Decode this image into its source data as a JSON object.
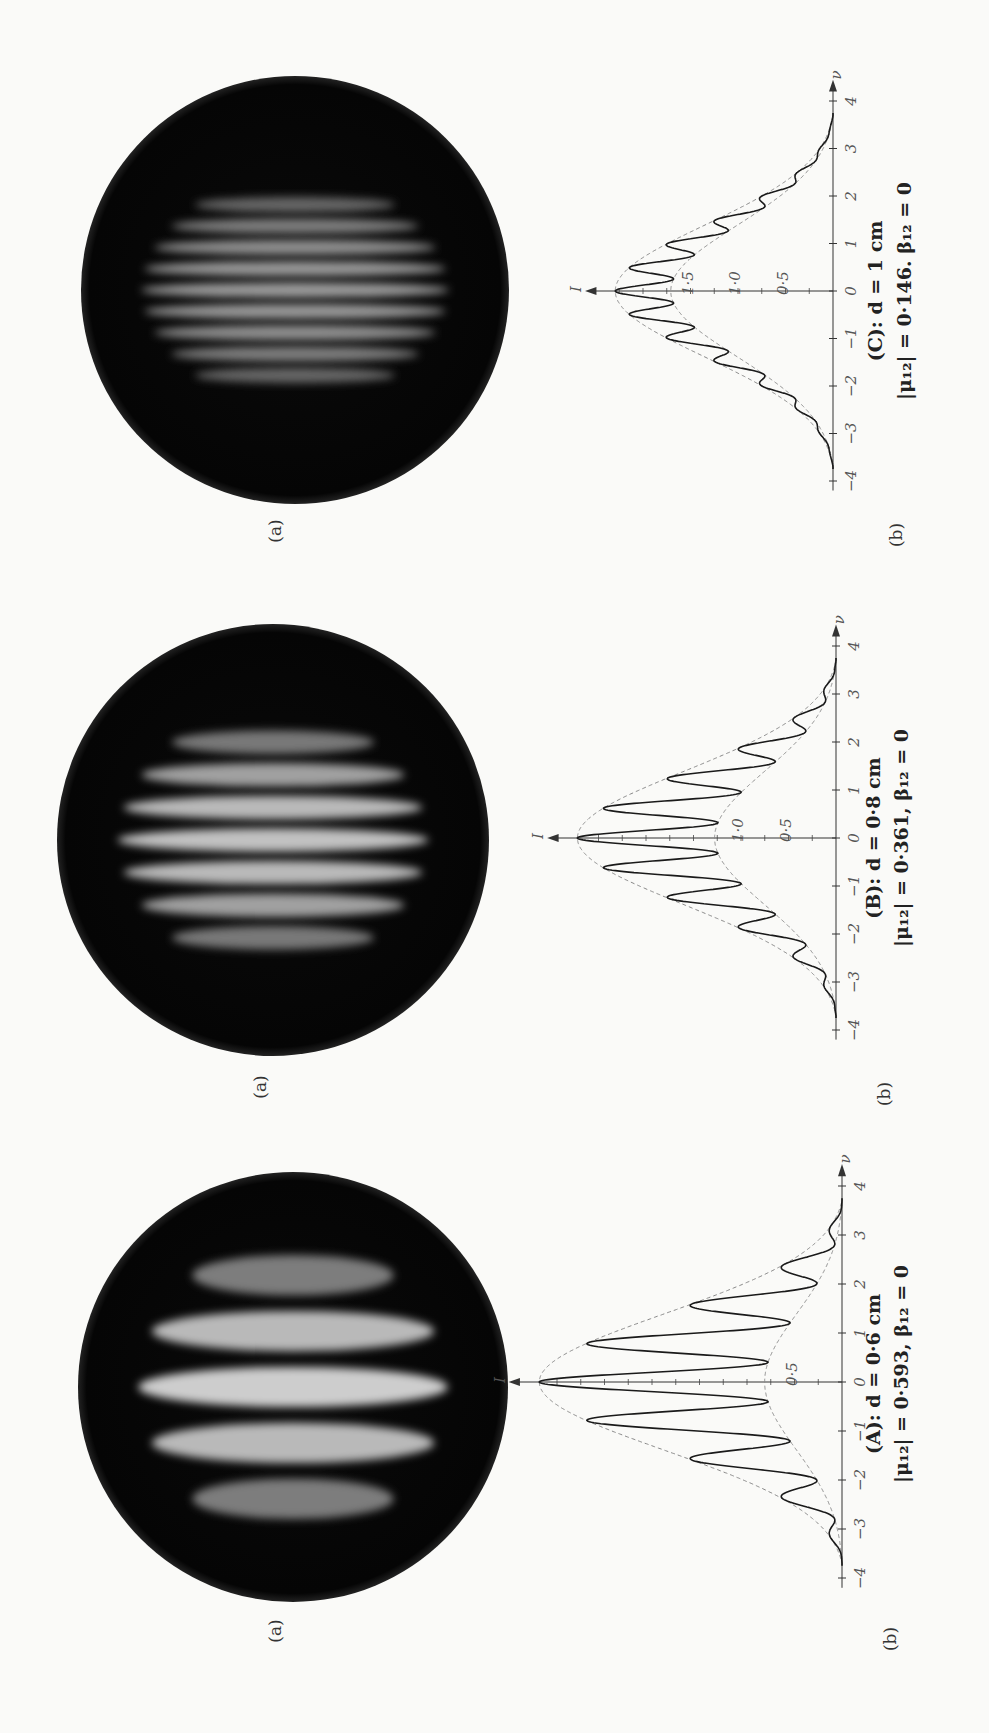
{
  "figure": {
    "orientation": "rotated-90-ccw",
    "panels": [
      {
        "id": "C",
        "photo_label": "(a)",
        "plot_label": "(b)",
        "caption_line1": "(C): d = 1 cm",
        "caption_line2": "|μ₁₂| = 0·146. β₁₂ = 0",
        "fringe_count": 9,
        "fringe_brightness": 0.55,
        "layout": {
          "disk_cx": 295,
          "disk_cy": 290,
          "disk_r": 214,
          "base_x": 833,
          "nu0_y": 291,
          "px_per_nu": 47.5,
          "px_per_I": 95,
          "photo_label_x": 281,
          "photo_label_y": 531,
          "plot_label_x": 902,
          "plot_label_y": 535,
          "cap_x1": 882,
          "cap_x2": 911,
          "cap_y": 291
        }
      },
      {
        "id": "B",
        "photo_label": "(a)",
        "plot_label": "(b)",
        "caption_line1": "(B): d = 0·8 cm",
        "caption_line2": "|μ₁₂| = 0·361, β₁₂ = 0",
        "fringe_count": 7,
        "fringe_brightness": 0.78,
        "layout": {
          "disk_cx": 273,
          "disk_cy": 840,
          "disk_r": 216,
          "base_x": 836,
          "nu0_y": 838,
          "px_per_nu": 48,
          "px_per_I": 95,
          "photo_label_x": 266,
          "photo_label_y": 1087,
          "plot_label_x": 890,
          "plot_label_y": 1094,
          "cap_x1": 880,
          "cap_x2": 908,
          "cap_y": 838
        }
      },
      {
        "id": "A",
        "photo_label": "(a)",
        "plot_label": "(b)",
        "caption_line1": "(A): d = 0·6 cm",
        "caption_line2": "|μ₁₂| = 0·593, β₁₂ = 0",
        "fringe_count": 5,
        "fringe_brightness": 0.85,
        "layout": {
          "disk_cx": 293,
          "disk_cy": 1387,
          "disk_r": 215,
          "base_x": 842,
          "nu0_y": 1382,
          "px_per_nu": 49,
          "px_per_I": 95,
          "photo_label_x": 281,
          "photo_label_y": 1631,
          "plot_label_x": 896,
          "plot_label_y": 1639,
          "cap_x1": 880,
          "cap_x2": 908,
          "cap_y": 1374
        }
      }
    ]
  },
  "chart_data": [
    {
      "type": "line",
      "title": "(C): d = 1 cm, |μ12| = 0·146, β12 = 0",
      "xlabel": "ν",
      "ylabel": "I",
      "x_ticks": [
        -4,
        -3,
        -2,
        -1,
        0,
        1,
        2,
        3,
        4
      ],
      "y_ticks": [
        0.5,
        1.0,
        1.5
      ],
      "xlim": [
        -4,
        4
      ],
      "ylim": [
        0,
        2.4
      ],
      "mu": 0.146,
      "fringe_period": 0.5,
      "envelope_upper_peak": 2.29,
      "envelope_lower_peak": 1.71,
      "series": [
        {
          "name": "intensity",
          "style": "solid",
          "x": [
            -3.5,
            -3,
            -2.5,
            -2,
            -1.5,
            -1,
            -0.5,
            0,
            0.5,
            1,
            1.5,
            2,
            2.5,
            3,
            3.5
          ],
          "values": [
            0.0,
            0.15,
            0.4,
            0.75,
            1.2,
            1.7,
            2.05,
            2.29,
            2.05,
            1.7,
            1.2,
            0.75,
            0.4,
            0.15,
            0.0
          ]
        },
        {
          "name": "upper envelope",
          "style": "dashed"
        },
        {
          "name": "lower envelope",
          "style": "dashed"
        }
      ]
    },
    {
      "type": "line",
      "title": "(B): d = 0·8 cm, |μ12| = 0·361, β12 = 0",
      "xlabel": "ν",
      "ylabel": "I",
      "x_ticks": [
        -4,
        -3,
        -2,
        -1,
        0,
        1,
        2,
        3,
        4
      ],
      "y_ticks": [
        0.5,
        1.0
      ],
      "xlim": [
        -4,
        4
      ],
      "ylim": [
        0,
        2.8
      ],
      "mu": 0.361,
      "fringe_period": 0.63,
      "envelope_upper_peak": 2.72,
      "envelope_lower_peak": 1.28,
      "series": [
        {
          "name": "intensity maxima",
          "style": "solid",
          "x": [
            -2.5,
            -1.9,
            -1.27,
            -0.63,
            0,
            0.63,
            1.27,
            1.9,
            2.5
          ],
          "values": [
            0.5,
            1.0,
            1.75,
            2.4,
            2.72,
            2.4,
            1.75,
            1.0,
            0.5
          ]
        },
        {
          "name": "upper envelope",
          "style": "dashed"
        },
        {
          "name": "lower envelope",
          "style": "dashed"
        }
      ]
    },
    {
      "type": "line",
      "title": "(A): d = 0·6 cm, |μ12| = 0·593, β12 = 0",
      "xlabel": "ν",
      "ylabel": "I",
      "x_ticks": [
        -4,
        -3,
        -2,
        -1,
        0,
        1,
        2,
        3,
        4
      ],
      "y_ticks": [
        0.5
      ],
      "xlim": [
        -4,
        4
      ],
      "ylim": [
        0,
        3.2
      ],
      "mu": 0.593,
      "fringe_period": 0.8,
      "envelope_upper_peak": 3.19,
      "envelope_lower_peak": 0.81,
      "series": [
        {
          "name": "intensity maxima",
          "style": "solid",
          "x": [
            -2.4,
            -1.6,
            -0.8,
            0,
            0.8,
            1.6,
            2.4
          ],
          "values": [
            0.6,
            1.7,
            2.75,
            3.19,
            2.75,
            1.7,
            0.6
          ]
        },
        {
          "name": "upper envelope",
          "style": "dashed"
        },
        {
          "name": "lower envelope",
          "style": "dashed"
        }
      ]
    }
  ]
}
